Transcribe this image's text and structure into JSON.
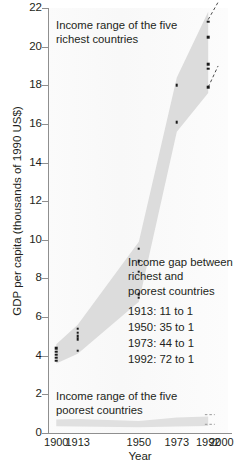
{
  "chart_data": {
    "type": "scatter",
    "title": "",
    "xlabel": "Year",
    "ylabel": "GDP per capita (thousands of 1990 US$)",
    "xlim": [
      1895,
      2004
    ],
    "ylim": [
      0,
      22
    ],
    "yticks": [
      0,
      2,
      4,
      6,
      8,
      10,
      12,
      14,
      16,
      18,
      20,
      22
    ],
    "xticks": [
      1900,
      1913,
      1950,
      1973,
      1992,
      2000
    ],
    "xtick_labels": [
      "1900",
      "1913",
      "1950",
      "1973",
      "1992",
      "2000"
    ],
    "grid": false,
    "legend_position": "none",
    "series": [
      {
        "name": "Income range of the five richest countries",
        "color": "#d6d6d6",
        "points": [
          {
            "x": 1900,
            "y": 4.4
          },
          {
            "x": 1900,
            "y": 4.2
          },
          {
            "x": 1900,
            "y": 4.05
          },
          {
            "x": 1900,
            "y": 3.9
          },
          {
            "x": 1900,
            "y": 3.75
          },
          {
            "x": 1913,
            "y": 5.4
          },
          {
            "x": 1913,
            "y": 5.2
          },
          {
            "x": 1913,
            "y": 5.0
          },
          {
            "x": 1913,
            "y": 4.85
          },
          {
            "x": 1913,
            "y": 4.25
          },
          {
            "x": 1950,
            "y": 9.55
          },
          {
            "x": 1950,
            "y": 8.9
          },
          {
            "x": 1950,
            "y": 8.35
          },
          {
            "x": 1950,
            "y": 7.2
          },
          {
            "x": 1950,
            "y": 7.0
          },
          {
            "x": 1973,
            "y": 18.0
          },
          {
            "x": 1973,
            "y": 16.1
          },
          {
            "x": 1992,
            "y": 21.3
          },
          {
            "x": 1992,
            "y": 20.5
          },
          {
            "x": 1992,
            "y": 19.1
          },
          {
            "x": 1992,
            "y": 18.85
          },
          {
            "x": 1992,
            "y": 17.9
          }
        ]
      },
      {
        "name": "Income range of the five poorest countries",
        "color": "#dcdcdc",
        "points": []
      }
    ],
    "bands": [
      {
        "name": "richest-band",
        "color": "#dcdcdc",
        "upper": [
          {
            "x": 1900,
            "y": 4.6
          },
          {
            "x": 1913,
            "y": 5.6
          },
          {
            "x": 1950,
            "y": 9.9
          },
          {
            "x": 1973,
            "y": 18.4
          },
          {
            "x": 1992,
            "y": 21.8
          }
        ],
        "lower": [
          {
            "x": 1900,
            "y": 3.6
          },
          {
            "x": 1913,
            "y": 4.1
          },
          {
            "x": 1950,
            "y": 6.8
          },
          {
            "x": 1973,
            "y": 15.6
          },
          {
            "x": 1992,
            "y": 17.6
          }
        ]
      },
      {
        "name": "poorest-band",
        "color": "#e0e0e0",
        "upper": [
          {
            "x": 1900,
            "y": 0.7
          },
          {
            "x": 1913,
            "y": 0.72
          },
          {
            "x": 1950,
            "y": 0.62
          },
          {
            "x": 1973,
            "y": 0.8
          },
          {
            "x": 1992,
            "y": 0.85
          }
        ],
        "lower": [
          {
            "x": 1900,
            "y": 0.35
          },
          {
            "x": 1913,
            "y": 0.34
          },
          {
            "x": 1950,
            "y": 0.3
          },
          {
            "x": 1973,
            "y": 0.34
          },
          {
            "x": 1992,
            "y": 0.36
          }
        ]
      }
    ],
    "projections": [
      {
        "x1": 1992,
        "y1": 21.4,
        "x2": 1998,
        "y2": 22.3
      },
      {
        "x1": 1992,
        "y1": 17.9,
        "x2": 1998,
        "y2": 19.0
      }
    ],
    "annotations": [
      {
        "name": "richest-annotation",
        "text": "Income range of the five\nrichest countries",
        "x_px": 56,
        "y_px": 18
      },
      {
        "name": "poorest-annotation",
        "text": "Income range of the five\npoorest countries",
        "x_px": 56,
        "y_px": 389
      },
      {
        "name": "income-gap-title",
        "text": "Income gap between\nrichest and\npoorest countries",
        "x_px": 128,
        "y_px": 255
      }
    ],
    "gap_rows": [
      {
        "label": "1913:  11 to 1"
      },
      {
        "label": "1950:  35 to 1"
      },
      {
        "label": "1973:  44 to 1"
      },
      {
        "label": "1992:  72 to 1"
      }
    ]
  },
  "colors": {
    "band": "#dcdcdc",
    "point": "#1a1a1a",
    "axis": "#8f8f8f",
    "text": "#231f20",
    "background": "#ffffff"
  }
}
